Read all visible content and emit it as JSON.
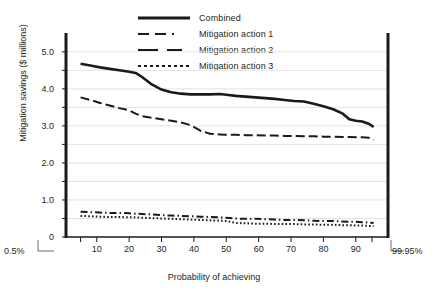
{
  "legend": {
    "items": [
      {
        "label": "Combined",
        "style": "solid",
        "name": "legend-combined"
      },
      {
        "label": "Mitigation action 1",
        "style": "dashdot",
        "name": "legend-action-1"
      },
      {
        "label": "Mitigation action 2",
        "style": "dash",
        "name": "legend-action-2"
      },
      {
        "label": "Mitigation action 3",
        "style": "dot",
        "name": "legend-action-3"
      }
    ]
  },
  "axes": {
    "ylabel": "Mitigation savings ($ millions)",
    "xlabel": "Probability of achieving",
    "yticks": [
      "5.0",
      "4.0",
      "3.0",
      "2.0",
      "1.0",
      "0"
    ],
    "xticks": [
      "10",
      "20",
      "30",
      "40",
      "50",
      "60",
      "70",
      "80",
      "90"
    ],
    "left_end_label": "0.5%",
    "right_end_label": "99.95%"
  },
  "chart_data": {
    "type": "line",
    "title": "",
    "xlabel": "Probability of achieving",
    "ylabel": "Mitigation savings ($ millions)",
    "xlim": [
      0.5,
      99.95
    ],
    "ylim": [
      0,
      5.4
    ],
    "grid": "horizontal",
    "legend_position": "top-center",
    "x": [
      5,
      8,
      11,
      14,
      17,
      20,
      22,
      24,
      27,
      30,
      33,
      36,
      39,
      42,
      45,
      48,
      50,
      53,
      56,
      59,
      62,
      65,
      68,
      71,
      74,
      77,
      80,
      83,
      86,
      88,
      90,
      92,
      94,
      95.5
    ],
    "series": [
      {
        "name": "Combined",
        "style": "solid",
        "values": [
          4.68,
          4.63,
          4.58,
          4.54,
          4.5,
          4.46,
          4.43,
          4.32,
          4.12,
          3.98,
          3.91,
          3.87,
          3.85,
          3.85,
          3.85,
          3.86,
          3.84,
          3.81,
          3.79,
          3.77,
          3.75,
          3.73,
          3.7,
          3.67,
          3.66,
          3.6,
          3.53,
          3.45,
          3.33,
          3.18,
          3.14,
          3.12,
          3.06,
          2.97
        ]
      },
      {
        "name": "Mitigation action 1",
        "style": "dashdot",
        "values": [
          0.68,
          0.67,
          0.66,
          0.65,
          0.65,
          0.64,
          0.63,
          0.62,
          0.61,
          0.59,
          0.58,
          0.57,
          0.56,
          0.55,
          0.54,
          0.53,
          0.52,
          0.5,
          0.49,
          0.49,
          0.48,
          0.47,
          0.46,
          0.46,
          0.45,
          0.44,
          0.43,
          0.43,
          0.42,
          0.41,
          0.41,
          0.4,
          0.39,
          0.38
        ]
      },
      {
        "name": "Mitigation action 2",
        "style": "dash",
        "values": [
          3.77,
          3.7,
          3.62,
          3.55,
          3.48,
          3.42,
          3.33,
          3.26,
          3.22,
          3.18,
          3.14,
          3.09,
          3.02,
          2.87,
          2.79,
          2.77,
          2.76,
          2.76,
          2.75,
          2.75,
          2.74,
          2.74,
          2.73,
          2.73,
          2.72,
          2.72,
          2.71,
          2.71,
          2.7,
          2.7,
          2.69,
          2.69,
          2.68,
          2.62
        ]
      },
      {
        "name": "Mitigation action 3",
        "style": "dot",
        "values": [
          0.57,
          0.56,
          0.55,
          0.54,
          0.54,
          0.53,
          0.53,
          0.52,
          0.51,
          0.5,
          0.49,
          0.48,
          0.47,
          0.46,
          0.45,
          0.44,
          0.43,
          0.38,
          0.37,
          0.36,
          0.36,
          0.35,
          0.35,
          0.35,
          0.34,
          0.34,
          0.33,
          0.33,
          0.32,
          0.32,
          0.31,
          0.31,
          0.3,
          0.3
        ]
      }
    ]
  }
}
